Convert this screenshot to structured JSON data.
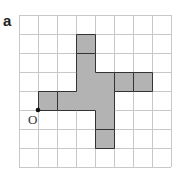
{
  "label": "a",
  "grid": {
    "cols": 8,
    "rows": 8,
    "cell": 19,
    "left": 19,
    "top": 15,
    "line_color": "#c8c8c8"
  },
  "shape": {
    "fill": "#b3b3b3",
    "stroke": "#333333",
    "cells": [
      [
        3,
        1
      ],
      [
        3,
        2
      ],
      [
        3,
        3
      ],
      [
        4,
        3
      ],
      [
        3,
        4
      ],
      [
        4,
        4
      ],
      [
        5,
        3
      ],
      [
        6,
        3
      ],
      [
        1,
        4
      ],
      [
        2,
        4
      ],
      [
        4,
        5
      ],
      [
        4,
        6
      ]
    ],
    "inner_lines": [
      [
        [
          3,
          2
        ],
        [
          4,
          2
        ]
      ],
      [
        [
          5,
          3
        ],
        [
          5,
          4
        ]
      ],
      [
        [
          6,
          3
        ],
        [
          6,
          4
        ]
      ],
      [
        [
          2,
          4
        ],
        [
          2,
          5
        ]
      ],
      [
        [
          4,
          6
        ],
        [
          5,
          6
        ]
      ]
    ]
  },
  "origin": {
    "label": "O",
    "col": 1,
    "row": 5
  }
}
